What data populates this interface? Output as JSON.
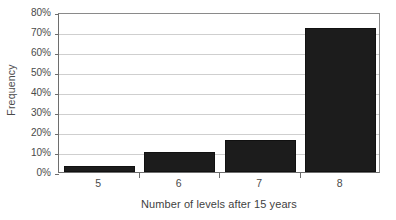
{
  "chart_data": {
    "type": "bar",
    "title": "",
    "xlabel": "Number of levels after 15 years",
    "ylabel": "Frequency",
    "categories": [
      "5",
      "6",
      "7",
      "8"
    ],
    "values": [
      3,
      10,
      16,
      72
    ],
    "value_labels": [
      "3%",
      "10%",
      "16%",
      "72%"
    ],
    "ylim": [
      0,
      80
    ],
    "ytick_values": [
      0,
      10,
      20,
      30,
      40,
      50,
      60,
      70,
      80
    ],
    "ytick_labels": [
      "0%",
      "10%",
      "20%",
      "30%",
      "40%",
      "50%",
      "60%",
      "70%",
      "80%"
    ],
    "grid": true,
    "legend": false,
    "bar_color": "#1c1c1c",
    "grid_color": "#cfcfcf",
    "axis_color": "#6e6e6e",
    "background_color": "#ffffff"
  }
}
